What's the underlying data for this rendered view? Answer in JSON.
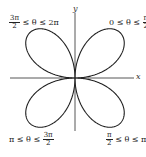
{
  "diagram": {
    "type": "polar-rose",
    "axes": {
      "x_label": "x",
      "y_label": "y"
    },
    "petals": [
      {
        "position": "upper-right",
        "label_pre": "0 ≤ θ ≤",
        "frac_num": "π",
        "frac_den": "2",
        "label_post": ""
      },
      {
        "position": "lower-right",
        "label_pre": "",
        "frac_num": "π",
        "frac_den": "2",
        "label_post": "≤ θ ≤ π"
      },
      {
        "position": "lower-left",
        "label_pre": "π ≤ θ ≤",
        "frac_num": "3π",
        "frac_den": "2",
        "label_post": ""
      },
      {
        "position": "upper-left",
        "label_pre": "",
        "frac_num": "3π",
        "frac_den": "2",
        "label_post": "≤ θ ≤ 2π"
      }
    ],
    "colors": {
      "curve": "#222222",
      "axis": "#444444",
      "background": "#ffffff"
    }
  }
}
